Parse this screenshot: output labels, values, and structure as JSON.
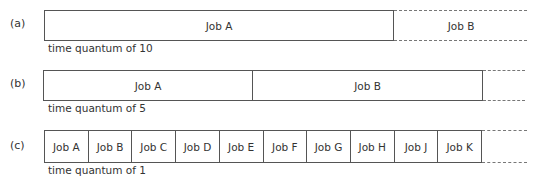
{
  "rows": [
    {
      "label": "(a)",
      "caption": "time quantum of 10",
      "jobs": [
        "Job A"
      ],
      "continuation_job": "Job B"
    },
    {
      "label": "(b)",
      "caption": "time quantum of 5",
      "jobs": [
        "Job A",
        "Job B"
      ]
    },
    {
      "label": "(c)",
      "caption": "time quantum of 1",
      "jobs": [
        "Job A",
        "Job B",
        "Job C",
        "Job D",
        "Job E",
        "Job F",
        "Job G",
        "Job H",
        "Job J",
        "Job K"
      ]
    }
  ],
  "colors": {
    "line": "#555555",
    "text": "#333333",
    "dash": "#777777"
  }
}
